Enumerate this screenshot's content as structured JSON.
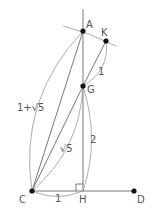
{
  "diagram": {
    "points": {
      "A": {
        "label": "A",
        "x": 83,
        "y": 31
      },
      "K": {
        "label": "K",
        "x": 106,
        "y": 41
      },
      "G": {
        "label": "G",
        "x": 83,
        "y": 86
      },
      "C": {
        "label": "C",
        "x": 32,
        "y": 191
      },
      "H": {
        "label": "H",
        "x": 83,
        "y": 191
      },
      "D": {
        "label": "D",
        "x": 134,
        "y": 191
      }
    },
    "lengths": {
      "CA": "1+√5",
      "CG": "√5",
      "GK": "1",
      "GH": "2",
      "CH": "1"
    },
    "colors": {
      "line": "#555555",
      "point": "#111111"
    }
  }
}
